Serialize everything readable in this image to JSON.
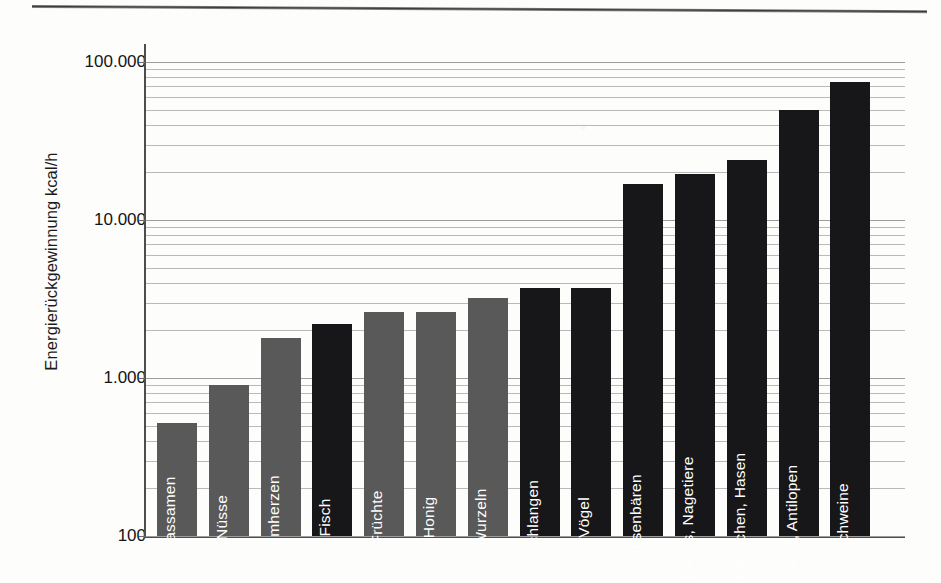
{
  "chart_data": {
    "type": "bar",
    "title": "",
    "subtitle": "",
    "xlabel": "",
    "ylabel": "Energierückgewinnung kcal/h",
    "yscale": "log",
    "ylim": [
      100,
      130000
    ],
    "grid": true,
    "legend": null,
    "ytick_labels": [
      "100",
      "1.000",
      "10.000",
      "100.000"
    ],
    "ytick_values": [
      100,
      1000,
      10000,
      100000
    ],
    "categories": [
      "Grassamen",
      "Nüsse",
      "Palmherzen",
      "Fisch",
      "Früchte",
      "Honig",
      "Wurzeln",
      "Schlangen",
      "Vögel",
      "Nasenbären",
      "Pakas, Nagetiere",
      "Kaninchen, Hasen",
      "Wild, Antilopen",
      "Schweine"
    ],
    "values": [
      520,
      900,
      1800,
      2200,
      2600,
      2600,
      3200,
      3700,
      3700,
      17000,
      19500,
      24000,
      50000,
      75000
    ],
    "colors": [
      "#595959",
      "#595959",
      "#595959",
      "#17171a",
      "#595959",
      "#595959",
      "#595959",
      "#17171a",
      "#17171a",
      "#17171a",
      "#17171a",
      "#17171a",
      "#17171a",
      "#17171a"
    ],
    "palette": {
      "plant_food": "#595959",
      "animal_food": "#17171a",
      "gridline": "#b9b9b9",
      "axis": "#4d4d4d",
      "background": "#fdfdfc",
      "label_text": "#ffffff"
    }
  }
}
